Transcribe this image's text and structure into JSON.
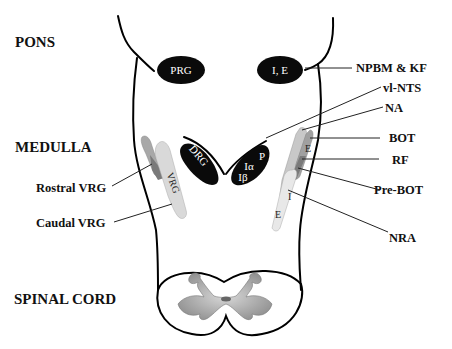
{
  "regions": {
    "pons": "PONS",
    "medulla": "MEDULLA",
    "spinal_cord": "SPINAL CORD"
  },
  "nuclei": {
    "prg": "PRG",
    "ie": "I, E",
    "drg": "DRG",
    "vrg_left": "VRG",
    "vnts_p": "P",
    "vnts_ia": "Iα",
    "vnts_ib": "Iβ",
    "right_col_top_e": "E",
    "right_col_mid_i": "I",
    "right_col_bottom_e": "E"
  },
  "labels": {
    "npbm_kf": "NPBM & KF",
    "vl_nts": "vl-NTS",
    "na": "NA",
    "bot": "BOT",
    "rf": "RF",
    "pre_bot": "Pre-BOT",
    "nra": "NRA",
    "rostral_vrg": "Rostral VRG",
    "caudal_vrg": "Caudal VRG"
  },
  "colors": {
    "nucleus_fill": "#0a0a0a",
    "column_light": "#d9d9d9",
    "column_mid": "#a8a8a8",
    "column_dark": "#7a7a7a",
    "gray_matter": "#9a9a9a"
  }
}
